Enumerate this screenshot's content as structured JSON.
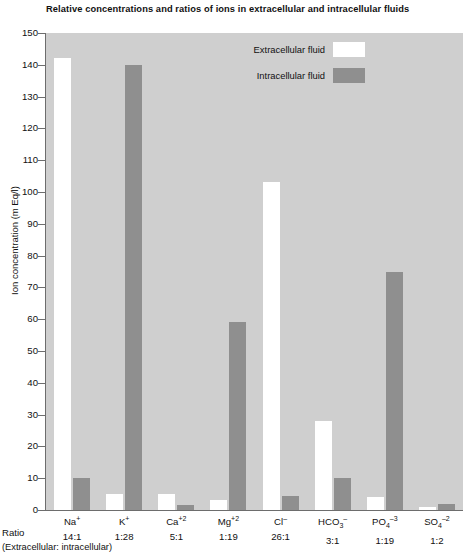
{
  "chart_data": {
    "type": "bar",
    "title": "Relative concentrations and ratios of ions in extracellular and intracellular fluids",
    "xlabel": "",
    "ylabel": "Ion concentration (m Eq/l)",
    "ylim": [
      0,
      150
    ],
    "ytick_step": 10,
    "yticks": [
      0,
      10,
      20,
      30,
      40,
      50,
      60,
      70,
      80,
      90,
      100,
      110,
      120,
      130,
      140,
      150
    ],
    "grid": false,
    "legend_position": "top-center",
    "categories": [
      "Na",
      "K",
      "Ca",
      "Mg",
      "Cl",
      "HCO3",
      "PO4",
      "SO4"
    ],
    "category_labels": [
      {
        "symbol": "Na",
        "charge": "+",
        "sub": "",
        "ratio": "14:1"
      },
      {
        "symbol": "K",
        "charge": "+",
        "sub": "",
        "ratio": "1:28"
      },
      {
        "symbol": "Ca",
        "charge": "+2",
        "sub": "",
        "ratio": "5:1"
      },
      {
        "symbol": "Mg",
        "charge": "+2",
        "sub": "",
        "ratio": "1:19"
      },
      {
        "symbol": "Cl",
        "charge": "–",
        "sub": "",
        "ratio": "26:1"
      },
      {
        "symbol": "HCO",
        "charge": "–",
        "sub": "3",
        "ratio": "3:1"
      },
      {
        "symbol": "PO",
        "charge": "–3",
        "sub": "4",
        "ratio": "1:19"
      },
      {
        "symbol": "SO",
        "charge": "–2",
        "sub": "4",
        "ratio": "1:2"
      }
    ],
    "series": [
      {
        "name": "Extracellular fluid",
        "color": "#ffffff",
        "values": [
          142,
          5,
          5,
          3,
          103,
          28,
          4,
          1
        ]
      },
      {
        "name": "Intracellular fluid",
        "color": "#8f8f8f",
        "values": [
          10,
          140,
          1.5,
          59,
          4.5,
          10,
          75,
          2
        ]
      }
    ],
    "ratios": [
      "14:1",
      "1:28",
      "5:1",
      "1:19",
      "26:1",
      "3:1",
      "1:19",
      "1:2"
    ],
    "axis_note_label": "Ratio",
    "axis_note": "(Extracellular: intracellular)",
    "plot_background": "#cfcfcf",
    "page_background": "#ffffff"
  },
  "legend": {
    "items": [
      {
        "label": "Extracellular fluid",
        "swatch": "white"
      },
      {
        "label": "Intracellular fluid",
        "swatch": "gray"
      }
    ]
  }
}
